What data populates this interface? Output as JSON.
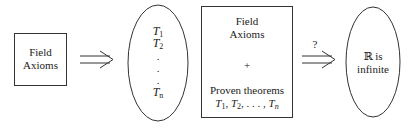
{
  "box1": {
    "line1": "Field",
    "line2": "Axioms"
  },
  "ellipse1": {
    "items": [
      {
        "var": "T",
        "sub": "1"
      },
      {
        "var": "T",
        "sub": "2"
      },
      {
        "var": "T",
        "sub": "n"
      }
    ],
    "dots": "."
  },
  "box2": {
    "line1": "Field",
    "line2": "Axioms",
    "plus": "+",
    "line3": "Proven theorems",
    "seq": {
      "t1": "T",
      "s1": "1",
      "t2": "T",
      "s2": "2",
      "ellipsis": ", . . . ,",
      "tn": "T",
      "sn": "n"
    }
  },
  "arrow_label": "?",
  "ellipse2": {
    "line1": "ℝ is",
    "line2": "infinite"
  },
  "colors": {
    "stroke": "#333333",
    "text": "#222222",
    "background": "#ffffff"
  }
}
